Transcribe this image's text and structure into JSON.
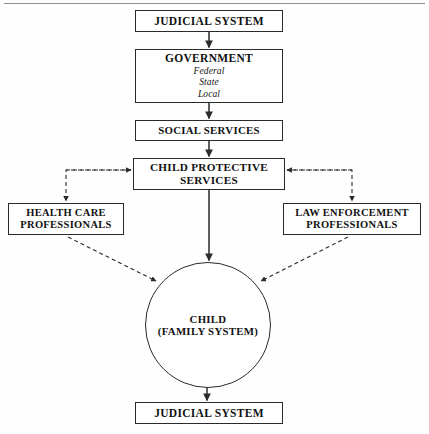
{
  "diagram": {
    "type": "flowchart",
    "nodes": {
      "judicial_top": {
        "label": "JUDICIAL SYSTEM"
      },
      "government": {
        "label": "GOVERNMENT",
        "levels": [
          "Federal",
          "State",
          "Local"
        ],
        "level_1": "Federal",
        "level_2": "State",
        "level_3": "Local"
      },
      "social_services": {
        "label": "SOCIAL SERVICES"
      },
      "child_protective_services": {
        "label": "CHILD PROTECTIVE SERVICES",
        "line_1": "CHILD PROTECTIVE",
        "line_2": "SERVICES"
      },
      "health_care": {
        "label": "HEALTH CARE PROFESSIONALS",
        "line_1": "HEALTH CARE",
        "line_2": "PROFESSIONALS"
      },
      "law_enforcement": {
        "label": "LAW ENFORCEMENT PROFESSIONALS",
        "line_1": "LAW ENFORCEMENT",
        "line_2": "PROFESSIONALS"
      },
      "child": {
        "label": "CHILD (FAMILY SYSTEM)",
        "line_1": "CHILD",
        "line_2": "(FAMILY SYSTEM)"
      },
      "judicial_bottom": {
        "label": "JUDICIAL SYSTEM"
      }
    },
    "edges": [
      {
        "from": "judicial_top",
        "to": "government",
        "style": "solid",
        "direction": "down"
      },
      {
        "from": "government",
        "to": "social_services",
        "style": "solid",
        "direction": "down"
      },
      {
        "from": "social_services",
        "to": "child_protective_services",
        "style": "solid",
        "direction": "down"
      },
      {
        "from": "child_protective_services",
        "to": "child",
        "style": "solid",
        "direction": "down"
      },
      {
        "from": "child_protective_services",
        "to": "health_care",
        "style": "dashed",
        "direction": "down-left"
      },
      {
        "from": "health_care",
        "to": "child_protective_services",
        "style": "dashed",
        "direction": "right"
      },
      {
        "from": "child_protective_services",
        "to": "law_enforcement",
        "style": "dashed",
        "direction": "down-right"
      },
      {
        "from": "law_enforcement",
        "to": "child_protective_services",
        "style": "dashed",
        "direction": "left"
      },
      {
        "from": "health_care",
        "to": "child",
        "style": "dashed",
        "direction": "diagonal-down-right"
      },
      {
        "from": "law_enforcement",
        "to": "child",
        "style": "dashed",
        "direction": "diagonal-down-left"
      },
      {
        "from": "child",
        "to": "judicial_bottom",
        "style": "solid",
        "direction": "down"
      }
    ]
  },
  "colors": {
    "line": "#2a2a2a",
    "text": "#111111",
    "background": "#fefefe",
    "rule": "#8d8d8d"
  }
}
